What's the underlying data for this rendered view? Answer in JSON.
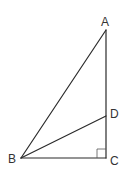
{
  "figure": {
    "type": "geometry-diagram",
    "colors": {
      "line": "#2b2b2b",
      "label": "#333333",
      "background": "#ffffff"
    },
    "vertices": {
      "A": {
        "label": "A",
        "x": 106,
        "y": 30
      },
      "B": {
        "label": "B",
        "x": 21,
        "y": 158
      },
      "C": {
        "label": "C",
        "x": 106,
        "y": 158
      },
      "D": {
        "label": "D",
        "x": 106,
        "y": 116
      }
    },
    "segments": [
      "AB",
      "AC",
      "BC",
      "BD"
    ],
    "right_angle_at": "C"
  }
}
